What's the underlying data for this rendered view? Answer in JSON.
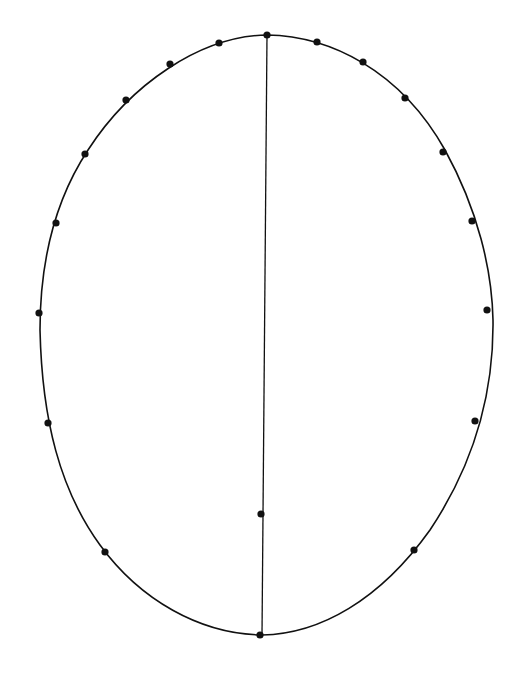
{
  "diagram": {
    "type": "egg-shaped oval with perimeter points and vertical axis",
    "background_color": "#ffffff",
    "stroke_color": "#111111",
    "outline": {
      "path": "M 267 35 C 330 36, 400 70, 445 150 C 478 210, 492 270, 493 320 C 494 400, 470 470, 430 530 C 380 600, 320 634, 262 635 C 200 634, 140 600, 100 545 C 60 490, 42 420, 40 330 C 40 260, 55 200, 88 150 C 130 85, 200 36, 267 35 Z",
      "stroke_width": 1.6
    },
    "axis_line": {
      "x1": 267,
      "y1": 35,
      "x2": 262,
      "y2": 635,
      "stroke_width": 1.3
    },
    "dot_radius": 3.6,
    "perimeter_points": [
      {
        "x": 267,
        "y": 35
      },
      {
        "x": 317,
        "y": 42
      },
      {
        "x": 363,
        "y": 62
      },
      {
        "x": 405,
        "y": 98
      },
      {
        "x": 443,
        "y": 152
      },
      {
        "x": 472,
        "y": 221
      },
      {
        "x": 487,
        "y": 310
      },
      {
        "x": 475,
        "y": 421
      },
      {
        "x": 414,
        "y": 550
      },
      {
        "x": 260,
        "y": 635
      },
      {
        "x": 105,
        "y": 552
      },
      {
        "x": 48,
        "y": 423
      },
      {
        "x": 39,
        "y": 313
      },
      {
        "x": 56,
        "y": 223
      },
      {
        "x": 85,
        "y": 154
      },
      {
        "x": 126,
        "y": 100
      },
      {
        "x": 170,
        "y": 64
      },
      {
        "x": 219,
        "y": 43
      }
    ],
    "inner_points": [
      {
        "x": 261,
        "y": 514
      }
    ]
  }
}
